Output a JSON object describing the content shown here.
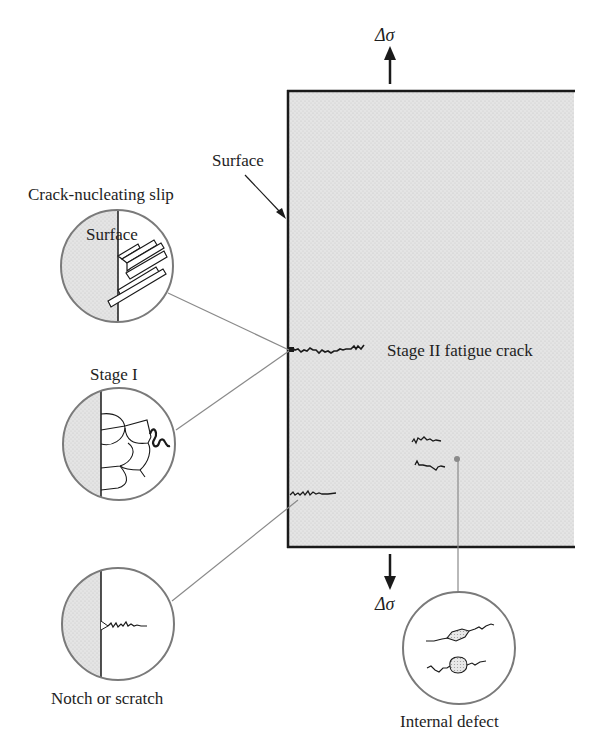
{
  "diagram": {
    "type": "fatigue-crack-initiation",
    "labels": {
      "delta_sigma_top": "Δσ",
      "delta_sigma_bottom": "Δσ",
      "surface": "Surface",
      "crack_nucleating_slip": "Crack-nucleating slip",
      "circle_surface": "Surface",
      "stage_i": "Stage I",
      "stage_ii": "Stage II fatigue crack",
      "notch": "Notch or scratch",
      "internal_defect": "Internal defect"
    },
    "colors": {
      "specimen_fill": "#d9d9d9",
      "outline": "#1a1a1a",
      "leader_line": "#8a8a8a",
      "circle_stroke": "#7a7a7a",
      "stipple": "#dcdcdc"
    }
  }
}
